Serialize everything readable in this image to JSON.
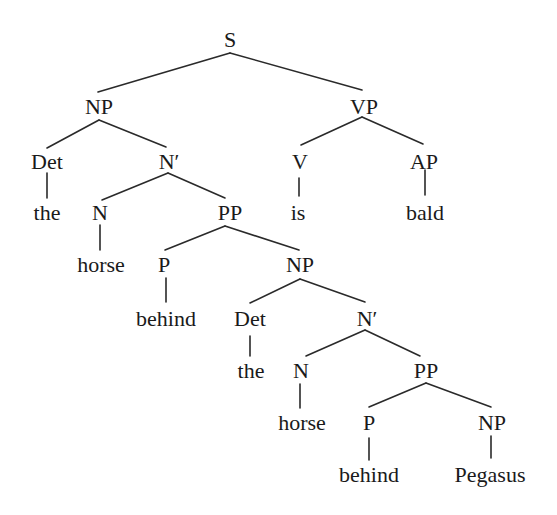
{
  "diagram": {
    "type": "syntax-tree",
    "line_color": "#2a2a2a",
    "text_color": "#1a1a1a",
    "nodes": [
      {
        "id": "S",
        "label": "S",
        "x": 230,
        "y": 40
      },
      {
        "id": "NP1",
        "label": "NP",
        "x": 99,
        "y": 107
      },
      {
        "id": "VP",
        "label": "VP",
        "x": 364,
        "y": 107
      },
      {
        "id": "Det1",
        "label": "Det",
        "x": 47,
        "y": 162
      },
      {
        "id": "Nbar1",
        "label": "N′",
        "x": 169,
        "y": 162
      },
      {
        "id": "V",
        "label": "V",
        "x": 300,
        "y": 162
      },
      {
        "id": "AP",
        "label": "AP",
        "x": 424,
        "y": 162
      },
      {
        "id": "the1",
        "label": "the",
        "x": 47,
        "y": 213
      },
      {
        "id": "N1",
        "label": "N",
        "x": 100,
        "y": 213
      },
      {
        "id": "PP1",
        "label": "PP",
        "x": 230,
        "y": 213
      },
      {
        "id": "is",
        "label": "is",
        "x": 298,
        "y": 213
      },
      {
        "id": "bald",
        "label": "bald",
        "x": 425,
        "y": 213
      },
      {
        "id": "horse1",
        "label": "horse",
        "x": 101,
        "y": 265
      },
      {
        "id": "P1",
        "label": "P",
        "x": 164,
        "y": 265
      },
      {
        "id": "NP2",
        "label": "NP",
        "x": 300,
        "y": 265
      },
      {
        "id": "behind1",
        "label": "behind",
        "x": 166,
        "y": 319
      },
      {
        "id": "Det2",
        "label": "Det",
        "x": 250,
        "y": 319
      },
      {
        "id": "Nbar2",
        "label": "N′",
        "x": 367,
        "y": 319
      },
      {
        "id": "the2",
        "label": "the",
        "x": 251,
        "y": 371
      },
      {
        "id": "N2",
        "label": "N",
        "x": 301,
        "y": 371
      },
      {
        "id": "PP2",
        "label": "PP",
        "x": 426,
        "y": 371
      },
      {
        "id": "horse2",
        "label": "horse",
        "x": 302,
        "y": 423
      },
      {
        "id": "P2",
        "label": "P",
        "x": 369,
        "y": 423
      },
      {
        "id": "NP3",
        "label": "NP",
        "x": 492,
        "y": 423
      },
      {
        "id": "behind2",
        "label": "behind",
        "x": 369,
        "y": 475
      },
      {
        "id": "Pegasus",
        "label": "Pegasus",
        "x": 490,
        "y": 475
      }
    ],
    "edges": [
      {
        "from": "S",
        "to": "NP1",
        "x1": 230,
        "y1": 53,
        "x2": 98,
        "y2": 92
      },
      {
        "from": "S",
        "to": "VP",
        "x1": 230,
        "y1": 53,
        "x2": 362,
        "y2": 90
      },
      {
        "from": "NP1",
        "to": "Det1",
        "x1": 99,
        "y1": 120,
        "x2": 47,
        "y2": 148
      },
      {
        "from": "NP1",
        "to": "Nbar1",
        "x1": 99,
        "y1": 120,
        "x2": 166,
        "y2": 147
      },
      {
        "from": "VP",
        "to": "V",
        "x1": 362,
        "y1": 117,
        "x2": 301,
        "y2": 145
      },
      {
        "from": "VP",
        "to": "AP",
        "x1": 362,
        "y1": 117,
        "x2": 423,
        "y2": 144
      },
      {
        "from": "Det1",
        "to": "the1",
        "x1": 47,
        "y1": 173,
        "x2": 47,
        "y2": 198
      },
      {
        "from": "Nbar1",
        "to": "N1",
        "x1": 168,
        "y1": 173,
        "x2": 102,
        "y2": 200
      },
      {
        "from": "Nbar1",
        "to": "PP1",
        "x1": 168,
        "y1": 173,
        "x2": 225,
        "y2": 198
      },
      {
        "from": "V",
        "to": "is",
        "x1": 299,
        "y1": 178,
        "x2": 299,
        "y2": 196
      },
      {
        "from": "AP",
        "to": "bald",
        "x1": 425,
        "y1": 170,
        "x2": 425,
        "y2": 195
      },
      {
        "from": "N1",
        "to": "horse1",
        "x1": 100,
        "y1": 225,
        "x2": 100,
        "y2": 250
      },
      {
        "from": "PP1",
        "to": "P1",
        "x1": 225,
        "y1": 226,
        "x2": 165,
        "y2": 250
      },
      {
        "from": "PP1",
        "to": "NP2",
        "x1": 225,
        "y1": 226,
        "x2": 299,
        "y2": 250
      },
      {
        "from": "P1",
        "to": "behind1",
        "x1": 166,
        "y1": 278,
        "x2": 166,
        "y2": 302
      },
      {
        "from": "NP2",
        "to": "Det2",
        "x1": 300,
        "y1": 279,
        "x2": 250,
        "y2": 303
      },
      {
        "from": "NP2",
        "to": "Nbar2",
        "x1": 300,
        "y1": 279,
        "x2": 365,
        "y2": 302
      },
      {
        "from": "Det2",
        "to": "the2",
        "x1": 250,
        "y1": 336,
        "x2": 250,
        "y2": 356
      },
      {
        "from": "Nbar2",
        "to": "N2",
        "x1": 365,
        "y1": 330,
        "x2": 306,
        "y2": 356
      },
      {
        "from": "Nbar2",
        "to": "PP2",
        "x1": 365,
        "y1": 330,
        "x2": 420,
        "y2": 356
      },
      {
        "from": "N2",
        "to": "horse2",
        "x1": 300,
        "y1": 384,
        "x2": 300,
        "y2": 408
      },
      {
        "from": "PP2",
        "to": "P2",
        "x1": 426,
        "y1": 383,
        "x2": 369,
        "y2": 407
      },
      {
        "from": "PP2",
        "to": "NP3",
        "x1": 426,
        "y1": 383,
        "x2": 491,
        "y2": 407
      },
      {
        "from": "P2",
        "to": "behind2",
        "x1": 369,
        "y1": 438,
        "x2": 369,
        "y2": 460
      },
      {
        "from": "NP3",
        "to": "Pegasus",
        "x1": 491,
        "y1": 436,
        "x2": 491,
        "y2": 458
      }
    ]
  }
}
